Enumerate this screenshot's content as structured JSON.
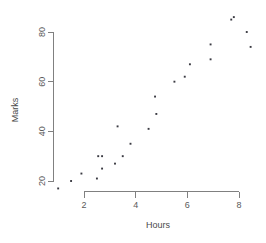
{
  "chart_data": {
    "type": "scatter",
    "title": "",
    "xlabel": "Hours",
    "ylabel": "Marks",
    "xlim": [
      0.7,
      8.7
    ],
    "ylim": [
      14,
      87
    ],
    "grid": false,
    "legend": null,
    "x_ticks": [
      2,
      4,
      6,
      8
    ],
    "y_ticks": [
      20,
      40,
      60,
      80
    ],
    "x_tick_labels": [
      "2",
      "4",
      "6",
      "8"
    ],
    "y_tick_labels": [
      "20",
      "40",
      "60",
      "80"
    ],
    "point_color": "#3a3a42",
    "axis_color": "#808080",
    "marker": "square",
    "x": [
      1.0,
      1.5,
      1.9,
      2.5,
      2.55,
      2.7,
      2.7,
      3.2,
      3.3,
      3.5,
      3.8,
      4.5,
      4.75,
      4.8,
      5.5,
      5.9,
      6.1,
      6.9,
      6.9,
      7.7,
      7.8,
      8.3,
      8.45
    ],
    "y": [
      17,
      20,
      23,
      21,
      30,
      30,
      25,
      27,
      42,
      30,
      35,
      41,
      54,
      47,
      60,
      62,
      67,
      69,
      75,
      85,
      86,
      80,
      74
    ],
    "points": [
      {
        "x": 1.0,
        "y": 17
      },
      {
        "x": 1.5,
        "y": 20
      },
      {
        "x": 1.9,
        "y": 23
      },
      {
        "x": 2.5,
        "y": 21
      },
      {
        "x": 2.55,
        "y": 30
      },
      {
        "x": 2.7,
        "y": 30
      },
      {
        "x": 2.7,
        "y": 25
      },
      {
        "x": 3.2,
        "y": 27
      },
      {
        "x": 3.3,
        "y": 42
      },
      {
        "x": 3.5,
        "y": 30
      },
      {
        "x": 3.8,
        "y": 35
      },
      {
        "x": 4.5,
        "y": 41
      },
      {
        "x": 4.75,
        "y": 54
      },
      {
        "x": 4.8,
        "y": 47
      },
      {
        "x": 5.5,
        "y": 60
      },
      {
        "x": 5.9,
        "y": 62
      },
      {
        "x": 6.1,
        "y": 67
      },
      {
        "x": 6.9,
        "y": 69
      },
      {
        "x": 6.9,
        "y": 75
      },
      {
        "x": 7.7,
        "y": 85
      },
      {
        "x": 7.8,
        "y": 86
      },
      {
        "x": 8.3,
        "y": 80
      },
      {
        "x": 8.45,
        "y": 74
      }
    ]
  },
  "axes": {
    "x_title": "Hours",
    "y_title": "Marks"
  }
}
